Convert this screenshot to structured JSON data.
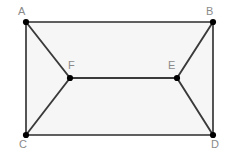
{
  "figure": {
    "type": "geometry-diagram",
    "canvas": {
      "width": 235,
      "height": 158
    },
    "style": {
      "background_color": "#ffffff",
      "interior_fill_color": "#f6f6f6",
      "edge_color": "#2b2b2b",
      "inner_edge_color": "#4a4a4a",
      "vertex_dot_color": "#000000",
      "label_color": "#8a8a8a",
      "edge_width": 1.6,
      "inner_edge_width": 1.8,
      "vertex_dot_radius": 3.1
    },
    "points": [
      {
        "id": "A",
        "label": "A",
        "x": 26,
        "y": 22,
        "label_x": 18,
        "label_y": 6,
        "dot": true
      },
      {
        "id": "B",
        "label": "B",
        "x": 213,
        "y": 22,
        "label_x": 206,
        "label_y": 6,
        "dot": true
      },
      {
        "id": "C",
        "label": "C",
        "x": 26,
        "y": 135,
        "label_x": 19,
        "label_y": 138,
        "dot": true
      },
      {
        "id": "D",
        "label": "D",
        "x": 213,
        "y": 135,
        "label_x": 211,
        "label_y": 138,
        "dot": true
      },
      {
        "id": "F",
        "label": "F",
        "x": 70,
        "y": 78,
        "label_x": 68,
        "label_y": 60,
        "dot": true
      },
      {
        "id": "E",
        "label": "E",
        "x": 177,
        "y": 78,
        "label_x": 168,
        "label_y": 60,
        "dot": true
      }
    ],
    "interior_polygon": "26,22 213,22 213,135 26,135",
    "edges": [
      {
        "id": "AB",
        "from": "A",
        "to": "B",
        "kind": "outer"
      },
      {
        "id": "BD",
        "from": "B",
        "to": "D",
        "kind": "outer"
      },
      {
        "id": "DC",
        "from": "D",
        "to": "C",
        "kind": "outer"
      },
      {
        "id": "CA",
        "from": "C",
        "to": "A",
        "kind": "outer"
      },
      {
        "id": "AF",
        "from": "A",
        "to": "F",
        "kind": "inner"
      },
      {
        "id": "CF",
        "from": "C",
        "to": "F",
        "kind": "inner"
      },
      {
        "id": "FE",
        "from": "F",
        "to": "E",
        "kind": "inner"
      },
      {
        "id": "EB",
        "from": "E",
        "to": "B",
        "kind": "inner"
      },
      {
        "id": "ED",
        "from": "E",
        "to": "D",
        "kind": "inner"
      }
    ]
  }
}
